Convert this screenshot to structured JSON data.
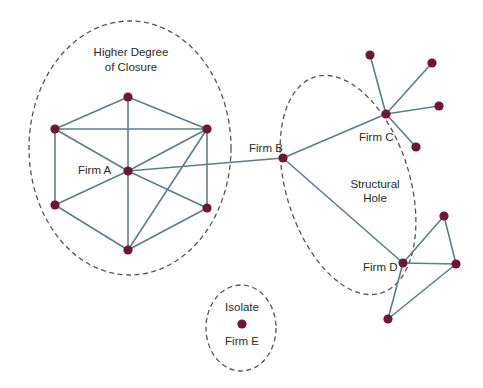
{
  "diagram": {
    "type": "network",
    "colors": {
      "node": "#6a1836",
      "edge": "#5f7c89",
      "boundary": "#555555",
      "text": "#2a2a2a"
    },
    "regions": {
      "closure": {
        "label_line1": "Higher Degree",
        "label_line2": "of Closure"
      },
      "structural_hole": {
        "label_line1": "Structural",
        "label_line2": "Hole"
      },
      "isolate": {
        "label": "Isolate"
      }
    },
    "firms": {
      "a": "Firm A",
      "b": "Firm B",
      "c": "Firm C",
      "d": "Firm D",
      "e": "Firm E"
    },
    "nodes": [
      {
        "id": "A",
        "x": 128,
        "y": 171
      },
      {
        "id": "A_top",
        "x": 128,
        "y": 97
      },
      {
        "id": "A_ul",
        "x": 55,
        "y": 129
      },
      {
        "id": "A_ur",
        "x": 207,
        "y": 129
      },
      {
        "id": "A_ll",
        "x": 55,
        "y": 205
      },
      {
        "id": "A_lr",
        "x": 207,
        "y": 208
      },
      {
        "id": "A_bot",
        "x": 128,
        "y": 250
      },
      {
        "id": "B",
        "x": 283,
        "y": 158
      },
      {
        "id": "C",
        "x": 386,
        "y": 114
      },
      {
        "id": "C1",
        "x": 370,
        "y": 55
      },
      {
        "id": "C2",
        "x": 432,
        "y": 63
      },
      {
        "id": "C3",
        "x": 439,
        "y": 106
      },
      {
        "id": "C4",
        "x": 416,
        "y": 147
      },
      {
        "id": "D",
        "x": 403,
        "y": 263
      },
      {
        "id": "D1",
        "x": 444,
        "y": 216
      },
      {
        "id": "D2",
        "x": 456,
        "y": 264
      },
      {
        "id": "D3",
        "x": 388,
        "y": 319
      },
      {
        "id": "E",
        "x": 242,
        "y": 324
      }
    ],
    "edges": [
      [
        "A_top",
        "A_ul"
      ],
      [
        "A_top",
        "A_ur"
      ],
      [
        "A_top",
        "A"
      ],
      [
        "A_ul",
        "A_ur"
      ],
      [
        "A_ul",
        "A"
      ],
      [
        "A_ul",
        "A_ll"
      ],
      [
        "A_ur",
        "A"
      ],
      [
        "A_ur",
        "A_lr"
      ],
      [
        "A_ur",
        "A_bot"
      ],
      [
        "A",
        "A_ll"
      ],
      [
        "A",
        "A_lr"
      ],
      [
        "A",
        "A_bot"
      ],
      [
        "A_ll",
        "A_bot"
      ],
      [
        "A_lr",
        "A_bot"
      ],
      [
        "A",
        "B"
      ],
      [
        "B",
        "C"
      ],
      [
        "B",
        "D"
      ],
      [
        "C",
        "C1"
      ],
      [
        "C",
        "C2"
      ],
      [
        "C",
        "C3"
      ],
      [
        "C",
        "C4"
      ],
      [
        "D",
        "D1"
      ],
      [
        "D1",
        "D2"
      ],
      [
        "D",
        "D2"
      ],
      [
        "D",
        "D3"
      ],
      [
        "D3",
        "D2"
      ]
    ]
  }
}
